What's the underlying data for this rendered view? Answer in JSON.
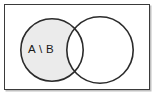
{
  "figure": {
    "type": "venn-diagram",
    "caption_label": "A \\ B",
    "frame": {
      "border_color": "#3a3a3a",
      "background_color": "#ffffff"
    },
    "shading": {
      "fill_color": "#ebebeb",
      "outline_color": "#2b2b2b",
      "region": "A \\ B"
    },
    "sets": [
      {
        "name": "A",
        "position": "left",
        "cx": 51,
        "cy": 49,
        "r": 32,
        "shaded": true
      },
      {
        "name": "B",
        "position": "right",
        "cx": 99,
        "cy": 49,
        "r": 34,
        "shaded": false
      }
    ],
    "label": {
      "text": "A \\ B",
      "x": 40,
      "y": 48
    }
  }
}
